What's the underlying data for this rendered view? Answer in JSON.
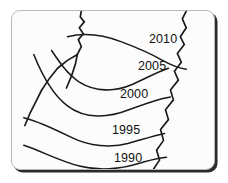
{
  "figure": {
    "kind": "contour-isoline-map",
    "frame": {
      "border_color": "#b9b9b9",
      "background_color": "#fcfcfc",
      "shadow_color": "#2b2b2b",
      "corner_radius": "9px"
    },
    "line_color": "#1a1a1a",
    "label_color": "#111111"
  },
  "contours": [
    {
      "label": "2010",
      "x": 148,
      "y": 32,
      "order": 1,
      "path": "M 56 26 C 72 22, 92 24, 110 31 C 126 37, 140 43, 152 50 C 161 55, 169 58, 176 59"
    },
    {
      "label": "2005",
      "x": 137,
      "y": 59,
      "order": 2,
      "path": "M 40 40 C 48 52, 56 64, 68 72 C 84 82, 104 82, 120 75 C 134 69, 146 62, 158 58"
    },
    {
      "label": "2000",
      "x": 119,
      "y": 87,
      "order": 3,
      "path": "M 22 44 C 30 64, 40 84, 56 96 C 74 110, 98 108, 118 100 C 134 94, 148 89, 160 87"
    },
    {
      "label": "1995",
      "x": 111,
      "y": 123,
      "order": 4,
      "path": "M 12 108 C 28 112, 44 120, 60 128 C 78 137, 100 139, 118 134 C 132 130, 144 126, 154 124"
    },
    {
      "label": "1990",
      "x": 113,
      "y": 151,
      "order": 5,
      "path": "M 12 136 C 30 142, 48 152, 68 157 C 88 162, 110 160, 126 155 C 138 151, 148 149, 156 148"
    }
  ],
  "boundaries": [
    {
      "name": "top-center-divide",
      "path": "M 70 0 L 69 6 L 73 11 L 68 17 L 72 23 L 67 29 L 70 36 L 66 44 L 64 54 L 60 66 L 55 78"
    },
    {
      "name": "left-branch-divide",
      "path": "M 66 44 L 56 50 L 46 58 L 38 68 L 30 80 L 24 92 L 18 104 L 13 116"
    },
    {
      "name": "right-edge-divide",
      "path": "M 176 0 L 172 8 L 176 17 L 170 26 L 174 34 L 167 43 L 171 52 L 164 61 L 168 70 L 160 80 L 163 90 L 155 100 L 158 110 L 150 120 L 153 131 L 146 141 L 149 151 L 143 160"
    }
  ]
}
